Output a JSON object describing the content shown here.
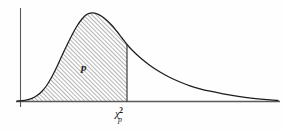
{
  "figure": {
    "background_color": "#fefefe",
    "curve_color": "#1c1c1c",
    "axis_color": "#5a5a5a",
    "hatch_color": "#3a3a3a"
  },
  "labels": {
    "area_label": "p",
    "xtick_base": "χ",
    "xtick_superscript": "2",
    "xtick_subscript": "p"
  },
  "chart_data": {
    "type": "area",
    "title": "",
    "subtitle": "",
    "xlabel": "",
    "ylabel": "",
    "legend": [],
    "grid": false,
    "axes": {
      "x_axis_shown": true,
      "y_axis_shown": true,
      "x_ticks": [
        {
          "label": "χ²ₚ",
          "pixel_x": 127
        }
      ],
      "y_ticks": []
    },
    "annotations": [
      {
        "text": "p",
        "meaning": "shaded probability area to the left of the critical value",
        "pixel_x": 85,
        "pixel_y": 68
      },
      {
        "text": "χ²ₚ",
        "meaning": "critical value of the chi-square distribution at cumulative probability p",
        "pixel_x": 127,
        "pixel_y": 112
      }
    ],
    "distribution": "chi-square probability density function (right-skewed)",
    "shaded_region": {
      "from": "0",
      "to": "χ²ₚ",
      "area_label": "p",
      "fill_style": "diagonal-hatch"
    },
    "x": [
      17,
      22,
      27,
      32,
      37,
      42,
      47,
      52,
      57,
      62,
      67,
      72,
      77,
      82,
      87,
      92,
      97,
      102,
      107,
      112,
      117,
      122,
      127,
      132,
      140,
      150,
      160,
      170,
      180,
      190,
      200,
      210,
      220,
      232,
      245,
      258,
      270,
      278
    ],
    "y": [
      101,
      100.6,
      99.8,
      98.3,
      95.6,
      91.2,
      85.0,
      76.5,
      66.5,
      55.5,
      45.0,
      35.0,
      26.0,
      19.0,
      14.3,
      12.9,
      13.8,
      16.5,
      20.5,
      25.5,
      31.5,
      38.0,
      44.5,
      50.0,
      57.5,
      65.5,
      72.0,
      77.5,
      82.0,
      85.8,
      88.8,
      91.2,
      93.2,
      95.4,
      97.3,
      98.8,
      99.9,
      100.4
    ],
    "ylim": [
      101,
      12
    ],
    "xlim": [
      17,
      278
    ],
    "peak": {
      "pixel_x": 92,
      "pixel_y": 12.9
    }
  }
}
